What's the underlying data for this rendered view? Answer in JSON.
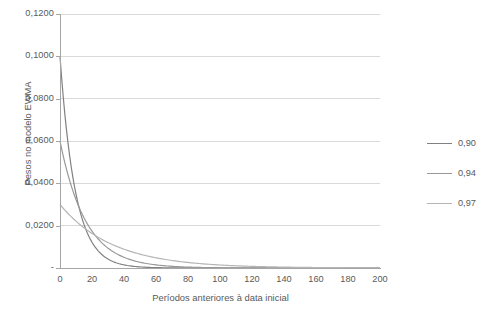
{
  "chart_data": {
    "type": "line",
    "title": "",
    "xlabel": "Períodos anteriores à data inicial",
    "ylabel": "Pesos no modelo EWMA",
    "xlim": [
      0,
      200
    ],
    "ylim": [
      0,
      0.12
    ],
    "grid": "horizontal",
    "legend_position": "right",
    "x_ticks": [
      {
        "value": 0,
        "label": "0"
      },
      {
        "value": 20,
        "label": "20"
      },
      {
        "value": 40,
        "label": "40"
      },
      {
        "value": 60,
        "label": "60"
      },
      {
        "value": 80,
        "label": "80"
      },
      {
        "value": 100,
        "label": "100"
      },
      {
        "value": 120,
        "label": "120"
      },
      {
        "value": 140,
        "label": "140"
      },
      {
        "value": 160,
        "label": "160"
      },
      {
        "value": 180,
        "label": "180"
      },
      {
        "value": 200,
        "label": "200"
      }
    ],
    "y_ticks": [
      {
        "value": 0.12,
        "label": "0,1200"
      },
      {
        "value": 0.1,
        "label": "0,1000"
      },
      {
        "value": 0.08,
        "label": "0,0800"
      },
      {
        "value": 0.06,
        "label": "0,0600"
      },
      {
        "value": 0.04,
        "label": "0,0400"
      },
      {
        "value": 0.02,
        "label": "0,0200"
      },
      {
        "value": 0.0,
        "label": "-"
      }
    ],
    "series": [
      {
        "name": "0,90",
        "lambda": 0.9,
        "color": "#808080",
        "formula": "(1-lambda)*lambda^t",
        "points": [
          [
            0,
            0.1
          ],
          [
            5,
            0.059
          ],
          [
            10,
            0.0349
          ],
          [
            15,
            0.0206
          ],
          [
            20,
            0.0122
          ],
          [
            25,
            0.0072
          ],
          [
            30,
            0.0042
          ],
          [
            35,
            0.0025
          ],
          [
            40,
            0.0015
          ],
          [
            45,
            0.0009
          ],
          [
            50,
            0.0005
          ],
          [
            60,
            0.0002
          ],
          [
            70,
            0.0001
          ],
          [
            80,
            0.0
          ],
          [
            90,
            0.0
          ],
          [
            100,
            0.0
          ],
          [
            120,
            0.0
          ],
          [
            140,
            0.0
          ],
          [
            160,
            0.0
          ],
          [
            180,
            0.0
          ],
          [
            200,
            0.0
          ]
        ]
      },
      {
        "name": "0,94",
        "lambda": 0.94,
        "color": "#989898",
        "formula": "(1-lambda)*lambda^t",
        "points": [
          [
            0,
            0.06
          ],
          [
            5,
            0.0441
          ],
          [
            10,
            0.0323
          ],
          [
            15,
            0.0238
          ],
          [
            20,
            0.0175
          ],
          [
            25,
            0.0128
          ],
          [
            30,
            0.0094
          ],
          [
            35,
            0.0069
          ],
          [
            40,
            0.0051
          ],
          [
            45,
            0.0037
          ],
          [
            50,
            0.0027
          ],
          [
            60,
            0.0015
          ],
          [
            70,
            0.0008
          ],
          [
            80,
            0.0004
          ],
          [
            90,
            0.0002
          ],
          [
            100,
            0.0001
          ],
          [
            120,
            0.0
          ],
          [
            140,
            0.0
          ],
          [
            160,
            0.0
          ],
          [
            180,
            0.0
          ],
          [
            200,
            0.0
          ]
        ]
      },
      {
        "name": "0,97",
        "lambda": 0.97,
        "color": "#b5b5b5",
        "formula": "(1-lambda)*lambda^t",
        "points": [
          [
            0,
            0.03
          ],
          [
            5,
            0.0258
          ],
          [
            10,
            0.0221
          ],
          [
            15,
            0.019
          ],
          [
            20,
            0.0163
          ],
          [
            25,
            0.014
          ],
          [
            30,
            0.012
          ],
          [
            35,
            0.0103
          ],
          [
            40,
            0.0089
          ],
          [
            45,
            0.0076
          ],
          [
            50,
            0.0065
          ],
          [
            60,
            0.0048
          ],
          [
            70,
            0.0035
          ],
          [
            80,
            0.0026
          ],
          [
            90,
            0.0019
          ],
          [
            100,
            0.0014
          ],
          [
            120,
            0.0008
          ],
          [
            140,
            0.0004
          ],
          [
            160,
            0.0002
          ],
          [
            180,
            0.0001
          ],
          [
            200,
            0.0001
          ]
        ]
      }
    ],
    "legend": [
      {
        "label": "0,90",
        "color": "#808080"
      },
      {
        "label": "0,94",
        "color": "#989898"
      },
      {
        "label": "0,97",
        "color": "#b5b5b5"
      }
    ],
    "gridline_color": "#d9d9d9",
    "axis_color": "#a6a6a6",
    "text_color": "#595959"
  }
}
